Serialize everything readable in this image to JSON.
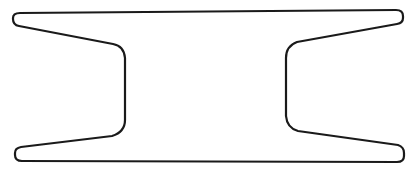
{
  "diagram": {
    "type": "line-drawing",
    "stroke_color": "#1a1a1a",
    "background_color": "#ffffff",
    "stroke_width": 2.2,
    "labels": []
  }
}
